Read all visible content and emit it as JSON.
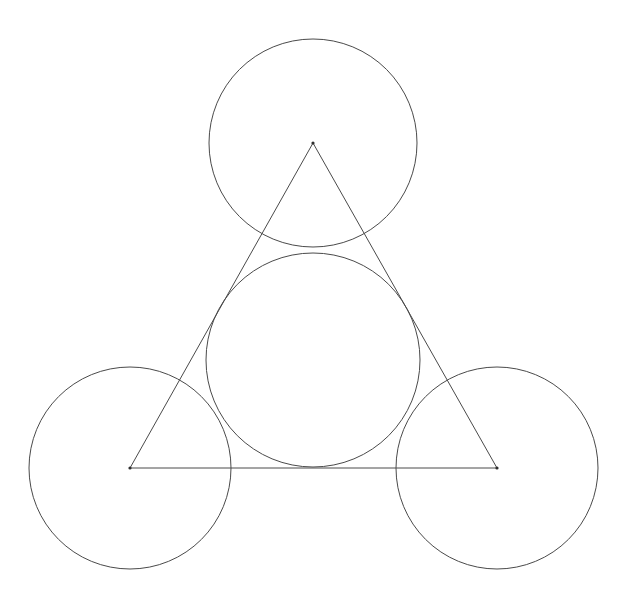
{
  "canvas": {
    "width": 642,
    "height": 611,
    "background_color": "#ffffff",
    "title": "Three congruent circles centered at the vertices of an equilateral triangle with its incircle"
  },
  "style": {
    "stroke_color": "#4a4a4a",
    "stroke_color_dark": "#2f2f2f",
    "stroke_width": 1,
    "fill": "none"
  },
  "chart_data": {
    "type": "scatter",
    "xlabel": "",
    "ylabel": "",
    "xlim": [
      0,
      642
    ],
    "ylim": [
      0,
      611
    ],
    "grid": false,
    "legend": "none",
    "units": "pixels",
    "shapes": [
      {
        "name": "equilateral-triangle",
        "kind": "polygon",
        "closed": true,
        "vertices": [
          {
            "label": "apex",
            "x": 313,
            "y": 143
          },
          {
            "label": "bottom-left",
            "x": 130,
            "y": 468
          },
          {
            "label": "bottom-right",
            "x": 497,
            "y": 468
          }
        ],
        "side_length": 367,
        "stroke": "#4a4a4a",
        "stroke_width": 1,
        "fill": "none"
      },
      {
        "name": "top-circle",
        "kind": "circle",
        "cx": 313,
        "cy": 143,
        "r": 104,
        "centered_on_vertex": "apex",
        "stroke": "#4a4a4a",
        "stroke_width": 1,
        "fill": "none"
      },
      {
        "name": "bottom-left-circle",
        "kind": "circle",
        "cx": 130,
        "cy": 468,
        "r": 101,
        "centered_on_vertex": "bottom-left",
        "stroke": "#4a4a4a",
        "stroke_width": 1,
        "fill": "none"
      },
      {
        "name": "bottom-right-circle",
        "kind": "circle",
        "cx": 497,
        "cy": 468,
        "r": 101,
        "centered_on_vertex": "bottom-right",
        "stroke": "#4a4a4a",
        "stroke_width": 1,
        "fill": "none"
      },
      {
        "name": "incircle",
        "kind": "circle",
        "cx": 313,
        "cy": 360,
        "r": 107,
        "description": "inscribed circle tangent to all three triangle sides",
        "stroke": "#4a4a4a",
        "stroke_width": 1,
        "fill": "none"
      }
    ],
    "vertex_markers": [
      {
        "label": "apex",
        "x": 313,
        "y": 143
      },
      {
        "label": "bottom-left",
        "x": 130,
        "y": 468
      },
      {
        "label": "bottom-right",
        "x": 497,
        "y": 468
      }
    ],
    "annotations": []
  }
}
